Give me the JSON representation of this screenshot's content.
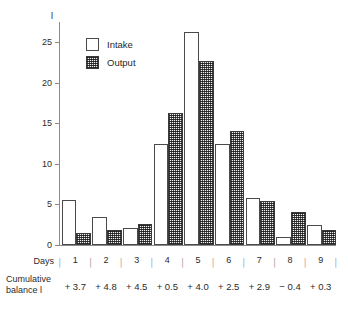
{
  "chart_data": {
    "type": "bar",
    "title": "",
    "xlabel": "Days",
    "ylabel": "",
    "y_unit": "l",
    "ylim": [
      0,
      27.5
    ],
    "yticks": [
      0,
      5,
      10,
      15,
      20,
      25
    ],
    "ytick_labels": [
      "0",
      "5",
      "10",
      "15",
      "20",
      "25"
    ],
    "grid": false,
    "legend_position": "top-left-inside",
    "categories": [
      "1",
      "2",
      "3",
      "4",
      "5",
      "6",
      "7",
      "8",
      "9"
    ],
    "series": [
      {
        "name": "Intake",
        "style": "white-filled-outline",
        "values": [
          5.5,
          3.4,
          2.1,
          12.5,
          26.3,
          12.5,
          5.8,
          1.0,
          2.5
        ]
      },
      {
        "name": "Output",
        "style": "hatched-dark",
        "values": [
          1.5,
          1.9,
          2.6,
          16.3,
          22.7,
          14.0,
          5.4,
          4.1,
          1.8
        ]
      }
    ],
    "annotations": {
      "cumulative_balance_label": "Cumulative balance l",
      "cumulative_balance_values": [
        "+ 3.7",
        "+ 4.8",
        "+ 4.5",
        "+ 0.5",
        "+ 4.0",
        "+ 2.5",
        "+ 2.9",
        "− 0.4",
        "+ 0.3"
      ]
    }
  },
  "axis": {
    "y_unit": "l",
    "ticks": [
      {
        "label": "25",
        "value": 25
      },
      {
        "label": "20",
        "value": 20
      },
      {
        "label": "15",
        "value": 15
      },
      {
        "label": "10",
        "value": 10
      },
      {
        "label": "5",
        "value": 5
      },
      {
        "label": "0",
        "value": 0
      }
    ]
  },
  "legend": {
    "items": [
      {
        "label": "Intake"
      },
      {
        "label": "Output"
      }
    ]
  },
  "footer": {
    "days_label": "Days",
    "balance_label_line1": "Cumulative",
    "balance_label_line2": "balance l",
    "day_numbers": [
      "1",
      "2",
      "3",
      "4",
      "5",
      "6",
      "7",
      "8",
      "9"
    ],
    "balance_values": [
      "+ 3.7",
      "+ 4.8",
      "+ 4.5",
      "+ 0.5",
      "+ 4.0",
      "+ 2.5",
      "+ 2.9",
      "− 0.4",
      "+ 0.3"
    ],
    "tickmark_glyph": "│"
  },
  "colors": {
    "axis": "#8b8b8b",
    "text": "#2b2b2b",
    "intake_fill": "#ffffff",
    "intake_border": "#4a4a4a",
    "output_fill": "#9a9a9a",
    "output_border": "#3a3a3a",
    "background": "#ffffff"
  }
}
